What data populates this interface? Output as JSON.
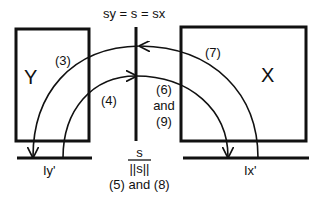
{
  "diagram": {
    "top_equation": "sy = s = sx",
    "boxes": {
      "left": {
        "label": "Y"
      },
      "right": {
        "label": "X"
      }
    },
    "arc_labels": {
      "outer_left": "(3)",
      "inner_left": "(4)",
      "outer_right": "(7)",
      "inner_right_line1": "(6)",
      "inner_right_line2": "and",
      "inner_right_line3": "(9)"
    },
    "bottom": {
      "fraction_numerator": "s",
      "fraction_denominator": "||s||",
      "caption": "(5) and (8)"
    },
    "ground_labels": {
      "left": "Iy'",
      "right": "Ix'"
    },
    "colors": {
      "stroke": "#111111",
      "background": "#ffffff"
    }
  }
}
